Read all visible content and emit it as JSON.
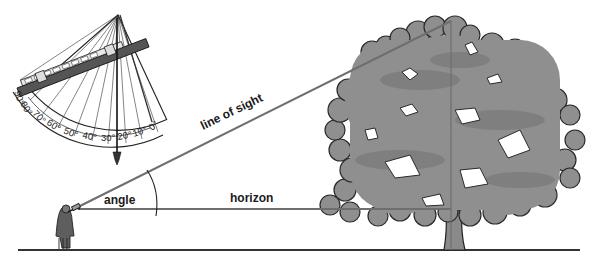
{
  "diagram": {
    "labels": {
      "line_of_sight": "line of sight",
      "horizon": "horizon",
      "angle": "angle"
    },
    "clinometer": {
      "scale_ticks": [
        "90°",
        "80°",
        "70°",
        "60°",
        "50°",
        "40°",
        "30°",
        "20°",
        "10°",
        "0°"
      ]
    },
    "colors": {
      "ink": "#1a1a1a",
      "line": "#6e6e6e",
      "foliage": "#8f8f8f",
      "foliage_dark": "#6f6f6f",
      "background": "#ffffff"
    }
  }
}
